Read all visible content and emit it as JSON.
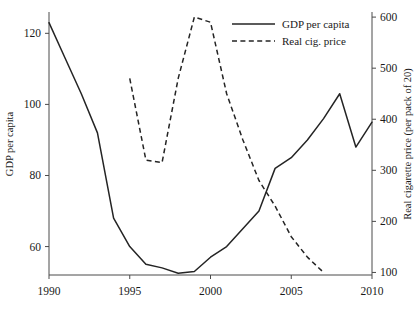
{
  "chart_data": {
    "type": "line",
    "title": "",
    "xlabel": "",
    "ylabel": "GDP per capita",
    "y2label": "Real cigarette price (per pack of 20)",
    "xlim": [
      1990,
      2010
    ],
    "ylim": [
      52,
      126
    ],
    "y2lim": [
      95,
      610
    ],
    "grid": false,
    "legend_position": "top-right",
    "xticks": [
      "1990",
      "1995",
      "2000",
      "2005",
      "2010"
    ],
    "xtick_values": [
      1990,
      1995,
      2000,
      2005,
      2010
    ],
    "yticks": [
      "60",
      "80",
      "100",
      "120"
    ],
    "ytick_values": [
      60,
      80,
      100,
      120
    ],
    "y2ticks": [
      "100",
      "200",
      "300",
      "400",
      "500",
      "600"
    ],
    "y2tick_values": [
      100,
      200,
      300,
      400,
      500,
      600
    ],
    "series": [
      {
        "name": "GDP per capita",
        "style": "solid",
        "axis": "left",
        "x": [
          1990,
          1991,
          1992,
          1993,
          1994,
          1995,
          1996,
          1997,
          1998,
          1999,
          2000,
          2001,
          2002,
          2003,
          2004,
          2005,
          2006,
          2007,
          2008,
          2009,
          2010
        ],
        "values": [
          123,
          113,
          103,
          92,
          68,
          60,
          55,
          54,
          52.5,
          53,
          57,
          60,
          65,
          70,
          82,
          85,
          90,
          96,
          103,
          88,
          95
        ]
      },
      {
        "name": "Real cig. price",
        "style": "dashed",
        "axis": "right",
        "x": [
          1995,
          1996,
          1997,
          1998,
          1999,
          2000,
          2001,
          2002,
          2003,
          2004,
          2005,
          2006,
          2007
        ],
        "values": [
          480,
          320,
          315,
          480,
          600,
          590,
          450,
          360,
          280,
          230,
          170,
          130,
          100
        ]
      }
    ]
  },
  "legend": {
    "entries": [
      {
        "label": "GDP per capita",
        "style": "solid"
      },
      {
        "label": "Real cig. price",
        "style": "dashed"
      }
    ]
  },
  "axes": {
    "left_title": "GDP per capita",
    "right_title": "Real cigarette price (per pack of 20)"
  }
}
